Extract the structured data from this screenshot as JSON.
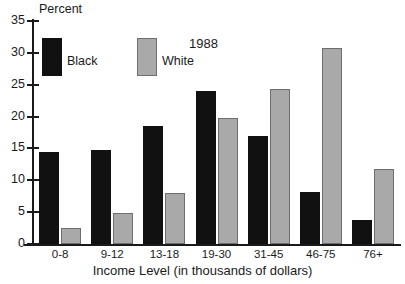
{
  "chart_data": {
    "type": "bar",
    "title": "1988",
    "ylabel": "Percent",
    "xlabel": "Income Level (in thousands of dollars)",
    "categories": [
      "0-8",
      "9-12",
      "13-18",
      "19-30",
      "31-45",
      "46-75",
      "76+"
    ],
    "series": [
      {
        "name": "Black",
        "color": "#111111",
        "values": [
          14.5,
          14.8,
          18.6,
          24.0,
          16.9,
          8.2,
          3.7
        ]
      },
      {
        "name": "White",
        "color": "#a9a9a9",
        "values": [
          2.5,
          4.8,
          8.0,
          19.7,
          24.4,
          30.8,
          11.8
        ]
      }
    ],
    "ylim": [
      0,
      35
    ],
    "yticks": [
      0,
      5,
      10,
      15,
      20,
      25,
      30,
      35
    ],
    "ytick_labels": [
      "0",
      "5",
      "10",
      "15",
      "20",
      "25",
      "30",
      "35"
    ],
    "grid": false,
    "legend_position": "upper-left-inside"
  },
  "legend": {
    "entries": [
      {
        "label": "Black",
        "swatch": "black"
      },
      {
        "label": "White",
        "swatch": "white"
      }
    ]
  }
}
